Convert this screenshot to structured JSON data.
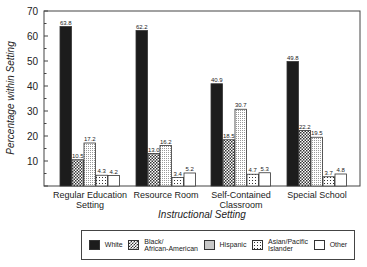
{
  "chart_data": {
    "type": "bar",
    "title": "",
    "xlabel": "Instructional Setting",
    "ylabel": "Percentage within Setting",
    "ylim": [
      0,
      70
    ],
    "yticks": [
      10,
      20,
      30,
      40,
      50,
      60,
      70
    ],
    "grid": false,
    "legend_position": "bottom",
    "categories": [
      "Regular Education Setting",
      "Resource Room",
      "Self-Contained Classroom",
      "Special School"
    ],
    "category_lines": [
      [
        "Regular Education",
        "Setting"
      ],
      [
        "Resource Room"
      ],
      [
        "Self-Contained",
        "Classroom"
      ],
      [
        "Special School"
      ]
    ],
    "series": [
      {
        "name": "White",
        "pattern": "solid-black",
        "values": [
          63.8,
          62.2,
          40.9,
          49.8
        ]
      },
      {
        "name": "Black/African-American",
        "pattern": "checker",
        "values": [
          10.5,
          13.0,
          18.5,
          22.2
        ]
      },
      {
        "name": "Hispanic",
        "pattern": "fine-dots",
        "values": [
          17.2,
          16.2,
          30.7,
          19.5
        ]
      },
      {
        "name": "Asian/Pacific Islander",
        "pattern": "grid-dots",
        "values": [
          4.3,
          3.4,
          4.7,
          3.7
        ]
      },
      {
        "name": "Other",
        "pattern": "white",
        "values": [
          4.2,
          5.2,
          5.3,
          4.8
        ]
      }
    ],
    "value_labels": [
      [
        "63.8",
        "62.2",
        "40.9",
        "49.8"
      ],
      [
        "10.5",
        "13.0",
        "18.5",
        "22.2"
      ],
      [
        "17.2",
        "16.2",
        "30.7",
        "19.5"
      ],
      [
        "4.3",
        "3.4",
        "4.7",
        "3.7"
      ],
      [
        "4.2",
        "5.2",
        "5.3",
        "4.8"
      ]
    ]
  },
  "legend": {
    "items": [
      {
        "line1": "White",
        "line2": ""
      },
      {
        "line1": "Black/",
        "line2": "African-American"
      },
      {
        "line1": "Hispanic",
        "line2": ""
      },
      {
        "line1": "Asian/Pacific",
        "line2": "Islander"
      },
      {
        "line1": "Other",
        "line2": ""
      }
    ]
  }
}
